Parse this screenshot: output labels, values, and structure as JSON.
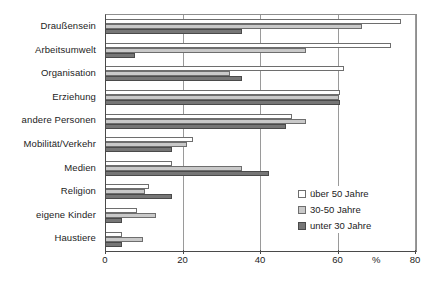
{
  "chart_data": {
    "type": "bar",
    "orientation": "horizontal",
    "grouped": true,
    "title": "",
    "subtitle": "",
    "xlabel": "%",
    "ylabel": "",
    "xlim": [
      0,
      80
    ],
    "xticks": [
      0,
      20,
      40,
      60,
      80
    ],
    "xtick_labels": [
      "0",
      "20",
      "40",
      "60",
      "80"
    ],
    "unit_label": "%",
    "grid": "vertical",
    "legend_position": "inside-right-lower",
    "categories": [
      "Draußensein",
      "Arbeitsumwelt",
      "Organisation",
      "Erziehung",
      "andere Personen",
      "Mobilität/Verkehr",
      "Medien",
      "Religion",
      "eigene Kinder",
      "Haustiere"
    ],
    "series": [
      {
        "name": "über 50 Jahre",
        "color": "#ffffff",
        "values": [
          76,
          73.5,
          61.5,
          60.5,
          48,
          22.5,
          17,
          11,
          8,
          4
        ]
      },
      {
        "name": "30-50 Jahre",
        "color": "#c9c9c9",
        "values": [
          66,
          51.5,
          32,
          60,
          51.5,
          21,
          35,
          10,
          13,
          9.5
        ]
      },
      {
        "name": "unter 30 Jahre",
        "color": "#767676",
        "values": [
          35,
          7.5,
          35,
          60.5,
          46.5,
          17,
          42,
          17,
          4,
          4
        ]
      }
    ]
  },
  "legend": {
    "items": [
      {
        "label": "über 50 Jahre",
        "swatch": "white"
      },
      {
        "label": "30-50 Jahre",
        "swatch": "light-gray"
      },
      {
        "label": "unter 30 Jahre",
        "swatch": "dark-gray"
      }
    ]
  }
}
